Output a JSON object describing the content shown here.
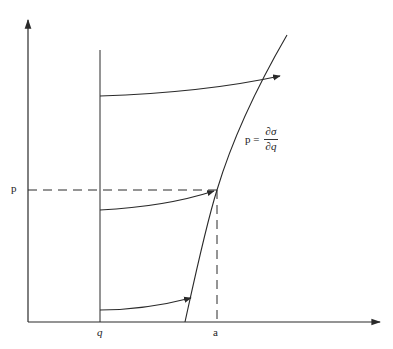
{
  "diagram": {
    "type": "phase-space-curve",
    "colors": {
      "stroke": "#2a2a2a",
      "background": "#ffffff"
    },
    "labels": {
      "y_tick_p": "p",
      "x_tick_q": "q",
      "x_tick_a": "a",
      "formula_lhs": "p =",
      "formula_num": "∂σ",
      "formula_den": "∂q"
    },
    "axes": {
      "origin": [
        28,
        322
      ],
      "y_axis_top": [
        28,
        18
      ],
      "x_axis_right": [
        382,
        322
      ]
    },
    "vertical_line_q": {
      "x": 100,
      "y_top": 50,
      "y_bottom": 322
    },
    "curve": {
      "path": "M185 322 C 196 272, 206 225, 217 190 C 232 140, 258 85, 287 35"
    },
    "dashed_p": {
      "y": 190,
      "x_from": 28,
      "x_to": 217
    },
    "dashed_a": {
      "x": 217,
      "y_from": 190,
      "y_to": 322
    },
    "arrows": [
      {
        "name": "arrow-top",
        "path": "M100 96 C 160 94, 225 88, 280 76"
      },
      {
        "name": "arrow-middle",
        "path": "M100 210 C 140 208, 180 202, 214 191"
      },
      {
        "name": "arrow-bottom",
        "path": "M100 310 C 130 310, 160 306, 191 298"
      }
    ]
  }
}
